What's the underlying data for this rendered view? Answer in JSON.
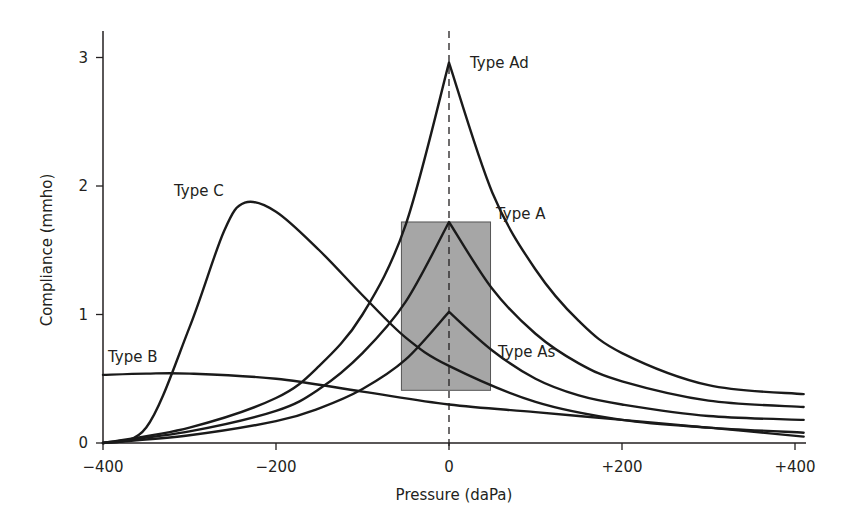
{
  "chart_data": {
    "type": "line",
    "title": "",
    "xlabel": "Pressure (daPa)",
    "ylabel": "Compliance (mmho)",
    "xlim": [
      -400,
      415
    ],
    "ylim": [
      0,
      3.2
    ],
    "xticks": [
      -400,
      -200,
      0,
      200,
      400
    ],
    "xtick_labels": [
      "−400",
      "−200",
      "0",
      "+200",
      "+400"
    ],
    "yticks": [
      0,
      1,
      2,
      3
    ],
    "ytick_labels": [
      "0",
      "1",
      "2",
      "3"
    ],
    "grid": false,
    "legend": "inline labels",
    "reference_line": {
      "x": 0,
      "style": "dashed"
    },
    "normal_range_box": {
      "x": [
        -55,
        48
      ],
      "y": [
        0.41,
        1.72
      ],
      "fill": "#a6a6a6"
    },
    "series": [
      {
        "name": "Type Ad",
        "x": [
          -400,
          -300,
          -200,
          -150,
          -100,
          -50,
          0,
          50,
          100,
          150,
          200,
          300,
          410
        ],
        "values": [
          0,
          0.12,
          0.35,
          0.6,
          1.0,
          1.7,
          2.96,
          1.95,
          1.35,
          0.95,
          0.7,
          0.45,
          0.38
        ]
      },
      {
        "name": "Type A",
        "x": [
          -400,
          -300,
          -200,
          -150,
          -100,
          -50,
          0,
          50,
          100,
          150,
          200,
          300,
          410
        ],
        "values": [
          0,
          0.09,
          0.25,
          0.42,
          0.7,
          1.1,
          1.72,
          1.2,
          0.85,
          0.62,
          0.48,
          0.33,
          0.28
        ]
      },
      {
        "name": "Type As",
        "x": [
          -400,
          -300,
          -200,
          -150,
          -100,
          -50,
          0,
          50,
          100,
          150,
          200,
          300,
          410
        ],
        "values": [
          0,
          0.06,
          0.17,
          0.27,
          0.42,
          0.65,
          1.02,
          0.72,
          0.5,
          0.37,
          0.3,
          0.21,
          0.18
        ]
      },
      {
        "name": "Type C",
        "x": [
          -400,
          -350,
          -300,
          -260,
          -236,
          -200,
          -150,
          -100,
          -50,
          0,
          100,
          200,
          300,
          410
        ],
        "values": [
          0,
          0.12,
          0.9,
          1.65,
          1.87,
          1.8,
          1.5,
          1.15,
          0.82,
          0.6,
          0.32,
          0.18,
          0.12,
          0.08
        ]
      },
      {
        "name": "Type B",
        "x": [
          -400,
          -350,
          -300,
          -200,
          -100,
          0,
          100,
          200,
          300,
          410
        ],
        "values": [
          0.53,
          0.54,
          0.54,
          0.5,
          0.4,
          0.3,
          0.24,
          0.18,
          0.12,
          0.05
        ]
      }
    ],
    "annotations": [
      "Type Ad",
      "Type A",
      "Type As",
      "Type C",
      "Type B"
    ]
  },
  "labels": {
    "x_axis_title": "Pressure (daPa)",
    "y_axis_title": "Compliance (mmho)",
    "x_ticks": [
      "−400",
      "−200",
      "0",
      "+200",
      "+400"
    ],
    "y_ticks": [
      "0",
      "1",
      "2",
      "3"
    ],
    "curve_labels": {
      "ad": "Type Ad",
      "a": "Type A",
      "as": "Type As",
      "c": "Type C",
      "b": "Type B"
    }
  }
}
